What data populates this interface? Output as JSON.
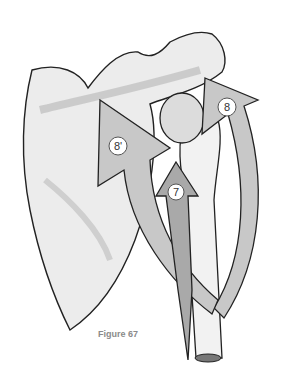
{
  "figure": {
    "caption": "Figure 67",
    "labels": [
      {
        "id": "arrow-8",
        "text": "8"
      },
      {
        "id": "arrow-8-prime",
        "text": "8'"
      },
      {
        "id": "arrow-7",
        "text": "7"
      }
    ]
  }
}
